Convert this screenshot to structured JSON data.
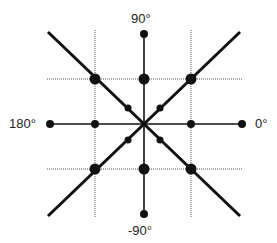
{
  "labels": {
    "top": "90°",
    "bottom": "-90°",
    "left": "180°",
    "right": "0°"
  },
  "colors": {
    "ink": "#111111",
    "grid": "#555555",
    "background": "#ffffff"
  },
  "geometry": {
    "center": [
      144,
      124
    ],
    "axis_ends": {
      "top": [
        144,
        34
      ],
      "bottom": [
        144,
        214
      ],
      "left": [
        50,
        124
      ],
      "right": [
        242,
        124
      ]
    },
    "diagonals": [
      {
        "from": [
          48,
          32
        ],
        "to": [
          240,
          216
        ]
      },
      {
        "from": [
          48,
          216
        ],
        "to": [
          240,
          32
        ]
      }
    ],
    "grid_vertical_x": [
      95,
      191
    ],
    "grid_horizontal_y": [
      79,
      169
    ],
    "grid_extent": {
      "x": [
        47,
        242
      ],
      "y": [
        30,
        217
      ]
    },
    "large_dots": [
      [
        95,
        79
      ],
      [
        191,
        79
      ],
      [
        95,
        169
      ],
      [
        191,
        169
      ],
      [
        144,
        79
      ],
      [
        144,
        169
      ]
    ],
    "medium_dots": [
      [
        144,
        34
      ],
      [
        144,
        214
      ],
      [
        50,
        124
      ],
      [
        242,
        124
      ],
      [
        95,
        124
      ],
      [
        191,
        124
      ]
    ],
    "small_dots": [
      [
        128,
        108
      ],
      [
        160,
        108
      ],
      [
        128,
        140
      ],
      [
        160,
        140
      ]
    ]
  }
}
